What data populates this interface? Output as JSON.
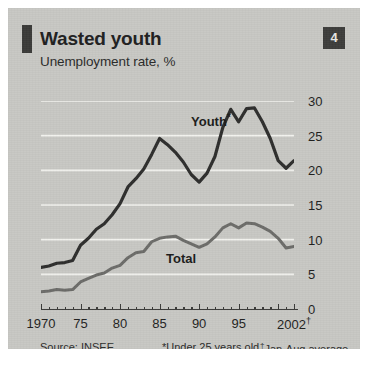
{
  "header": {
    "title": "Wasted youth",
    "subtitle": "Unemployment rate, %",
    "badge": "4"
  },
  "labels": {
    "youth": "Youth",
    "youth_marker": "*",
    "total": "Total"
  },
  "footnotes": {
    "source": "Source: INSEE",
    "star_note": "*Under 25 years old",
    "dagger_marker": "†",
    "dagger_note": "Jan-Aug average"
  },
  "colors": {
    "panel_background": "#c8c8c4",
    "gridline": "#f2f2ee",
    "youth_line": "#2e2e2d",
    "total_line": "#6c6c69",
    "axis": "#3a3a38",
    "badge_background": "#3d3d3b",
    "text": "#20201f"
  },
  "chart_data": {
    "type": "line",
    "title": "Wasted youth",
    "subtitle": "Unemployment rate, %",
    "xlabel": "",
    "ylabel": "Unemployment rate, %",
    "xlim": [
      1970,
      2002
    ],
    "ylim": [
      0,
      30
    ],
    "yticks": [
      0,
      5,
      10,
      15,
      20,
      25,
      30
    ],
    "ytick_labels": [
      "0",
      "5",
      "10",
      "15",
      "20",
      "25",
      "30"
    ],
    "xticks": [
      1970,
      1975,
      1980,
      1985,
      1990,
      1995,
      2002
    ],
    "xtick_labels": [
      "1970",
      "75",
      "80",
      "85",
      "90",
      "95",
      "2002†"
    ],
    "grid": true,
    "grid_axis": "y",
    "legend": "inline-labels",
    "x": [
      1970,
      1971,
      1972,
      1973,
      1974,
      1975,
      1976,
      1977,
      1978,
      1979,
      1980,
      1981,
      1982,
      1983,
      1984,
      1985,
      1986,
      1987,
      1988,
      1989,
      1990,
      1991,
      1992,
      1993,
      1994,
      1995,
      1996,
      1997,
      1998,
      1999,
      2000,
      2001,
      2002
    ],
    "series": [
      {
        "name": "Youth",
        "note": "Under 25 years old",
        "color": "#2e2e2d",
        "values": [
          6.0,
          6.2,
          6.6,
          6.7,
          7.0,
          9.2,
          10.2,
          11.5,
          12.3,
          13.6,
          15.2,
          17.6,
          18.8,
          20.2,
          22.3,
          24.6,
          23.7,
          22.6,
          21.2,
          19.4,
          18.3,
          19.6,
          22.0,
          26.2,
          28.8,
          27.0,
          28.9,
          29.0,
          27.0,
          24.6,
          21.4,
          20.3,
          21.4
        ]
      },
      {
        "name": "Total",
        "color": "#6c6c69",
        "values": [
          2.5,
          2.6,
          2.8,
          2.7,
          2.8,
          3.9,
          4.4,
          4.9,
          5.2,
          5.9,
          6.3,
          7.4,
          8.1,
          8.3,
          9.7,
          10.2,
          10.4,
          10.5,
          9.9,
          9.4,
          8.9,
          9.4,
          10.4,
          11.7,
          12.3,
          11.7,
          12.4,
          12.3,
          11.8,
          11.2,
          10.2,
          8.8,
          9.0
        ]
      }
    ]
  }
}
